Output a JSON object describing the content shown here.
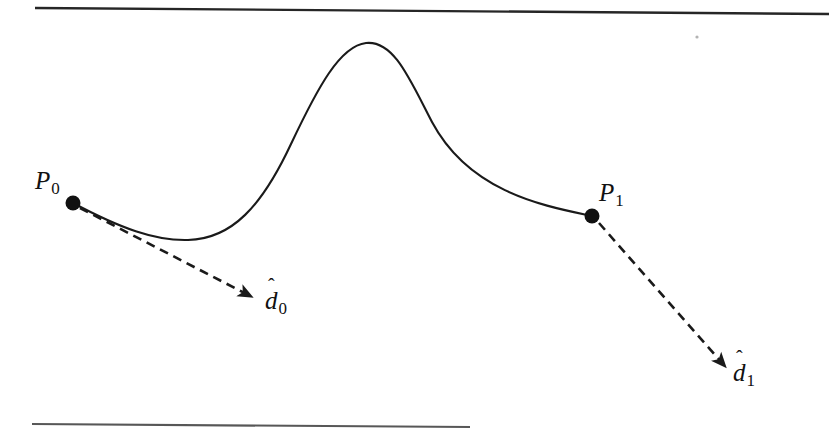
{
  "figure": {
    "kind": "hermite-spline-diagram",
    "background_color": "#ffffff",
    "ink_color": "#1a1a1a",
    "width": 830,
    "height": 433
  },
  "rules": {
    "top": {
      "name": "top-rule",
      "x1": 35,
      "y1": 8,
      "x2": 829,
      "y2": 14,
      "stroke_width": 2.4,
      "color": "#262626"
    },
    "bottom": {
      "name": "bottom-rule",
      "x1": 32,
      "y1": 424,
      "x2": 470,
      "y2": 427,
      "stroke_width": 2.2,
      "color": "#3a3a3a"
    }
  },
  "points": [
    {
      "id": "P0",
      "label": "P",
      "subscript": "0",
      "x": 73,
      "y": 203,
      "radius": 7.5,
      "label_x": 35,
      "label_y": 168
    },
    {
      "id": "P1",
      "label": "P",
      "subscript": "1",
      "x": 592,
      "y": 216,
      "radius": 7.5,
      "label_x": 599,
      "label_y": 180
    }
  ],
  "tangents": [
    {
      "id": "d0",
      "label": "d",
      "subscript": "0",
      "hat": "ˆ",
      "from_x": 80,
      "from_y": 208,
      "to_x": 258,
      "to_y": 300,
      "label_x": 265,
      "label_y": 288,
      "dash": "9 6",
      "stroke_width": 2.6
    },
    {
      "id": "d1",
      "label": "d",
      "subscript": "1",
      "hat": "ˆ",
      "from_x": 599,
      "from_y": 223,
      "to_x": 730,
      "to_y": 372,
      "label_x": 733,
      "label_y": 360,
      "dash": "9 6",
      "stroke_width": 2.6
    }
  ],
  "curve": {
    "name": "hermite-curve",
    "stroke_width": 2.1,
    "path": "M 73 203 C 120 228 155 241 188 240 C 232 239 262 206 291 144 C 318 87 340 46 366 43 C 394 40 410 80 432 122 C 470 193 545 206 592 216"
  },
  "speck": {
    "name": "scan-speck",
    "x": 697,
    "y": 37,
    "radius": 1.6
  }
}
